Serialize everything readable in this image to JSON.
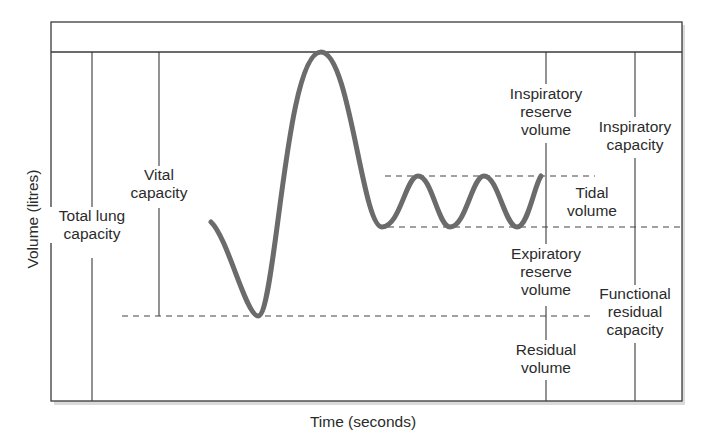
{
  "diagram": {
    "type": "spirometry-lung-volumes",
    "axes": {
      "x_label": "Time (seconds)",
      "y_label": "Volume (litres)"
    },
    "labels": {
      "total_lung_capacity": [
        "Total lung",
        "capacity"
      ],
      "vital_capacity": [
        "Vital",
        "capacity"
      ],
      "inspiratory_reserve_volume": [
        "Inspiratory",
        "reserve",
        "volume"
      ],
      "inspiratory_capacity": [
        "Inspiratory",
        "capacity"
      ],
      "tidal_volume": [
        "Tidal",
        "volume"
      ],
      "expiratory_reserve_volume": [
        "Expiratory",
        "reserve",
        "volume"
      ],
      "functional_residual_capacity": [
        "Functional",
        "residual",
        "capacity"
      ],
      "residual_volume": [
        "Residual",
        "volume"
      ]
    },
    "colors": {
      "frame": "#3a3a3a",
      "trace": "#6b6b6b",
      "dash": "#444444",
      "text": "#2b2b2b",
      "shadow": "#9a9a9a"
    },
    "trace_points": [
      [
        211,
        222
      ],
      [
        258,
        316
      ],
      [
        321,
        52
      ],
      [
        382,
        227
      ],
      [
        418,
        176
      ],
      [
        450,
        227
      ],
      [
        484,
        176
      ],
      [
        517,
        227
      ],
      [
        541,
        176
      ]
    ],
    "levels": {
      "tlc_y": 52,
      "tidal_top_y": 176,
      "tidal_bottom_y": 227,
      "residual_y": 316,
      "floor_y": 401
    }
  }
}
